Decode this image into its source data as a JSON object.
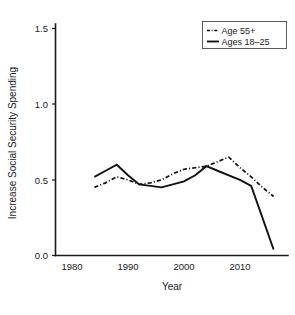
{
  "chart_data": {
    "type": "line",
    "title": "",
    "xlabel": "Year",
    "ylabel": "Increase Social Security Spending",
    "xlim": [
      1978,
      2018
    ],
    "ylim": [
      0.0,
      1.6
    ],
    "xticks": [
      1980,
      1990,
      2000,
      2010
    ],
    "xtick_labels": [
      "1980",
      "1990",
      "2000",
      "2010"
    ],
    "yticks": [
      0.0,
      0.5,
      1.0,
      1.5
    ],
    "ytick_labels": [
      "0.0",
      "0.5",
      "1.0",
      "1.5"
    ],
    "grid": false,
    "legend_position": "top-right",
    "x": [
      1984,
      1986,
      1988,
      1990,
      1992,
      1994,
      1996,
      1998,
      2000,
      2002,
      2004,
      2006,
      2008,
      2010,
      2012,
      2014,
      2016
    ],
    "series": [
      {
        "name": "Age 55+",
        "style": "dash-dot",
        "values": [
          0.45,
          0.48,
          0.52,
          0.5,
          0.47,
          0.48,
          0.5,
          0.54,
          0.57,
          0.58,
          0.59,
          0.62,
          0.65,
          0.58,
          0.52,
          0.45,
          0.39
        ]
      },
      {
        "name": "Ages 18–25",
        "style": "solid",
        "values": [
          0.52,
          0.56,
          0.6,
          0.53,
          0.47,
          0.46,
          0.45,
          0.47,
          0.49,
          0.53,
          0.59,
          0.56,
          0.53,
          0.5,
          0.46,
          0.25,
          0.04
        ]
      }
    ],
    "legend": [
      {
        "label": "Age 55+",
        "style": "dash-dot"
      },
      {
        "label": "Ages 18–25",
        "style": "solid"
      }
    ]
  }
}
